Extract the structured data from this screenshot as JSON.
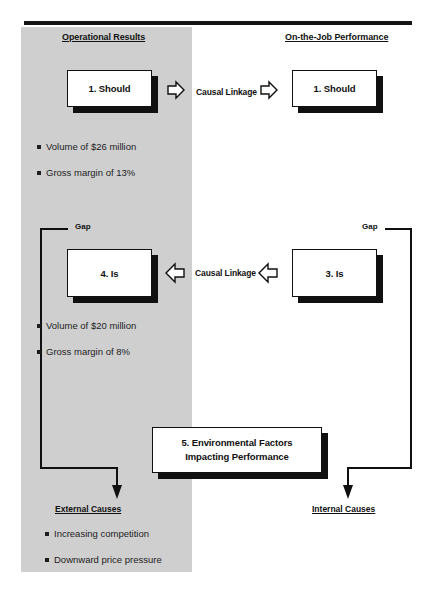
{
  "diagram": {
    "title_rule": "horizontal-rule",
    "columns": {
      "left_header": "Operational Results",
      "right_header": "On-the-Job Performance"
    },
    "boxes": {
      "should_left": "1. Should",
      "should_right": "1. Should",
      "is_left": "4. Is",
      "is_right": "3. Is",
      "environmental_line1": "5. Environmental Factors",
      "environmental_line2": "Impacting Performance"
    },
    "linkage": {
      "top": "Causal Linkage",
      "middle": "Causal Linkage"
    },
    "gap_labels": {
      "left": "Gap",
      "right": "Gap"
    },
    "cause_labels": {
      "left": "External Causes",
      "right": "Internal Causes"
    },
    "bullets": {
      "should_metrics": [
        "Volume of $26 million",
        "Gross margin of 13%"
      ],
      "is_metrics": [
        "Volume of $20 million",
        "Gross margin of 8%"
      ],
      "external_causes": [
        "Increasing competition",
        "Downward price pressure"
      ]
    },
    "colors": {
      "panel_gray": "#cfcfcf",
      "ink": "#101010",
      "page": "#ffffff"
    }
  }
}
